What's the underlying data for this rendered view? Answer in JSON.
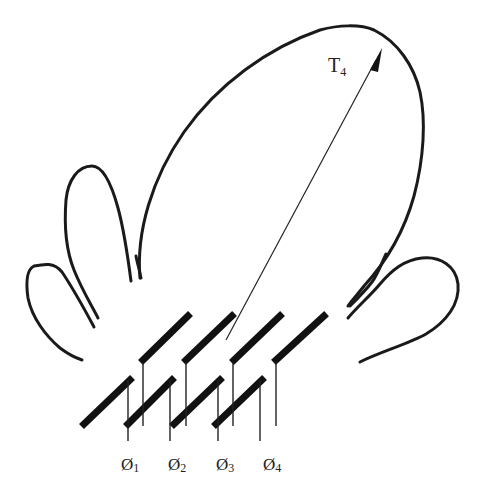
{
  "diagram": {
    "type": "phased-array-radiation-pattern",
    "beam_label": {
      "main": "T",
      "sub": "4"
    },
    "phase_labels": [
      {
        "symbol": "Ø",
        "sub": "1"
      },
      {
        "symbol": "Ø",
        "sub": "2"
      },
      {
        "symbol": "Ø",
        "sub": "3"
      },
      {
        "symbol": "Ø",
        "sub": "4"
      }
    ],
    "lobes": [
      "main-lobe",
      "left-side-lobe-1",
      "left-side-lobe-2",
      "right-side-lobe"
    ],
    "element_rows": 2,
    "elements_per_row": 4,
    "colors": {
      "line": "#1a1a1a",
      "background": "#ffffff"
    }
  }
}
